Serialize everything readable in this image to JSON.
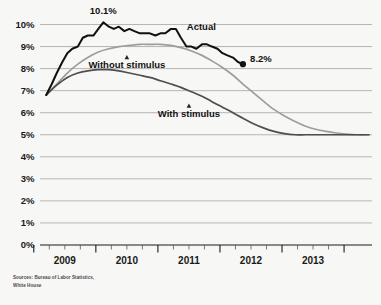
{
  "chart_data": {
    "type": "line",
    "title": "",
    "subtitle": "",
    "xlabel": "",
    "ylabel": "",
    "ylim": [
      0,
      10
    ],
    "ytick_labels": [
      "0%",
      "1%",
      "2%",
      "3%",
      "4%",
      "5%",
      "6%",
      "7%",
      "8%",
      "9%",
      "10%"
    ],
    "ytick_values": [
      0,
      1,
      2,
      3,
      4,
      5,
      6,
      7,
      8,
      9,
      10
    ],
    "xtick_labels": [
      "2009",
      "2010",
      "2011",
      "2012",
      "2013"
    ],
    "xtick_values": [
      2009,
      2010,
      2011,
      2012,
      2013
    ],
    "x_minor_ticks_per_year": 3,
    "xlim": [
      2008.6,
      2013.95
    ],
    "grid": true,
    "grid_axis": "y",
    "legend_position": "inline-annotations",
    "series": [
      {
        "name": "Actual",
        "color": "#111111",
        "x": [
          2008.7,
          2008.79,
          2008.87,
          2008.96,
          2009.04,
          2009.12,
          2009.21,
          2009.29,
          2009.37,
          2009.46,
          2009.54,
          2009.62,
          2009.71,
          2009.79,
          2009.87,
          2009.96,
          2010.04,
          2010.12,
          2010.21,
          2010.29,
          2010.37,
          2010.46,
          2010.54,
          2010.62,
          2010.71,
          2010.79,
          2010.87,
          2010.96,
          2011.04,
          2011.12,
          2011.21,
          2011.29,
          2011.37,
          2011.46,
          2011.54,
          2011.62,
          2011.71,
          2011.79,
          2011.87
        ],
        "values": [
          6.8,
          7.3,
          7.8,
          8.3,
          8.7,
          8.9,
          9.0,
          9.4,
          9.5,
          9.5,
          9.8,
          10.1,
          9.9,
          9.8,
          9.9,
          9.7,
          9.8,
          9.7,
          9.6,
          9.6,
          9.6,
          9.5,
          9.6,
          9.6,
          9.8,
          9.8,
          9.4,
          9.0,
          9.0,
          8.9,
          9.1,
          9.1,
          9.0,
          8.9,
          8.7,
          8.6,
          8.5,
          8.3,
          8.2
        ]
      },
      {
        "name": "Without stimulus",
        "color": "#9d9d9d",
        "x": [
          2008.7,
          2008.87,
          2009.04,
          2009.21,
          2009.37,
          2009.54,
          2009.71,
          2009.87,
          2010.04,
          2010.21,
          2010.37,
          2010.54,
          2010.71,
          2010.87,
          2011.04,
          2011.21,
          2011.37,
          2011.54,
          2011.71,
          2011.87,
          2012.04,
          2012.21,
          2012.37,
          2012.54,
          2012.71,
          2012.87,
          2013.04,
          2013.21,
          2013.37,
          2013.54,
          2013.71,
          2013.9
        ],
        "values": [
          6.8,
          7.3,
          7.8,
          8.2,
          8.5,
          8.75,
          8.9,
          9.0,
          9.05,
          9.1,
          9.1,
          9.1,
          9.05,
          8.95,
          8.8,
          8.6,
          8.35,
          8.05,
          7.7,
          7.3,
          6.9,
          6.5,
          6.15,
          5.85,
          5.6,
          5.4,
          5.25,
          5.15,
          5.08,
          5.03,
          5.0,
          5.0
        ]
      },
      {
        "name": "With stimulus",
        "color": "#4e4e4e",
        "x": [
          2008.7,
          2008.87,
          2009.04,
          2009.21,
          2009.37,
          2009.54,
          2009.71,
          2009.87,
          2010.04,
          2010.21,
          2010.37,
          2010.54,
          2010.71,
          2010.87,
          2011.04,
          2011.21,
          2011.37,
          2011.54,
          2011.71,
          2011.87,
          2012.04,
          2012.21,
          2012.37,
          2012.54,
          2012.71,
          2012.87,
          2013.04,
          2013.21,
          2013.37,
          2013.54,
          2013.71,
          2013.9
        ],
        "values": [
          6.8,
          7.25,
          7.6,
          7.8,
          7.9,
          7.95,
          7.95,
          7.9,
          7.8,
          7.7,
          7.6,
          7.45,
          7.3,
          7.15,
          6.95,
          6.75,
          6.5,
          6.25,
          6.0,
          5.75,
          5.5,
          5.3,
          5.15,
          5.05,
          5.0,
          5.0,
          5.0,
          5.0,
          5.0,
          5.0,
          5.0,
          5.0
        ]
      }
    ],
    "annotations": [
      {
        "id": "peak-label",
        "text": "10.1%",
        "x": 2009.62,
        "y": 10.1,
        "series": "Actual"
      },
      {
        "id": "end-label",
        "text": "8.2%",
        "x": 2011.87,
        "y": 8.2,
        "series": "Actual"
      },
      {
        "id": "actual-label",
        "text": "Actual",
        "x": 2011.2,
        "y": 9.75,
        "series": "Actual"
      },
      {
        "id": "without-label",
        "text": "Without stimulus",
        "x": 2010.0,
        "y": 8.45,
        "series": "Without stimulus"
      },
      {
        "id": "with-label",
        "text": "With stimulus",
        "x": 2011.0,
        "y": 6.25,
        "series": "With stimulus"
      }
    ]
  },
  "labels": {
    "ytick_0": "0%",
    "ytick_1": "1%",
    "ytick_2": "2%",
    "ytick_3": "3%",
    "ytick_4": "4%",
    "ytick_5": "5%",
    "ytick_6": "6%",
    "ytick_7": "7%",
    "ytick_8": "8%",
    "ytick_9": "9%",
    "ytick_10": "10%",
    "xtick_2009": "2009",
    "xtick_2010": "2010",
    "xtick_2011": "2011",
    "xtick_2012": "2012",
    "xtick_2013": "2013",
    "series_actual": "Actual",
    "series_without": "Without stimulus",
    "series_with": "With stimulus",
    "peak_value": "10.1%",
    "end_value": "8.2%"
  },
  "source": {
    "note": "Sources: Bureau of Labor Statistics,\nWhite House"
  },
  "colors": {
    "background": "#f7f7f5",
    "actual": "#111111",
    "without_stimulus": "#9d9d9d",
    "with_stimulus": "#4e4e4e",
    "gridline": "#9a9a9a",
    "axis": "#1a1a1a",
    "text": "#111111"
  }
}
